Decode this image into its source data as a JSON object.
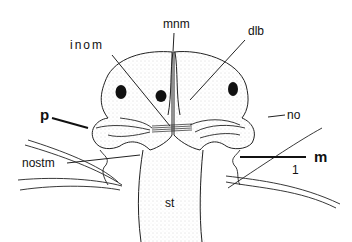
{
  "figure": {
    "labels": {
      "mnm": "mnm",
      "inom": "inom",
      "dlb": "dlb",
      "p": "p",
      "no": "no",
      "nostm": "nostm",
      "m": "m",
      "one": "1",
      "st": "st"
    },
    "colors": {
      "line": "#222222",
      "stipple": "#bbbbbb",
      "background": "#ffffff"
    }
  }
}
